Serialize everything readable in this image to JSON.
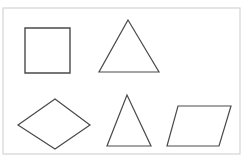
{
  "figure": {
    "canvas": {
      "width": 246,
      "height": 161,
      "background_color": "#ffffff"
    },
    "frame": {
      "name": "outer-frame",
      "x": 3,
      "y": 8,
      "width": 237,
      "height": 146,
      "stroke_color": "#d4d4d4",
      "stroke_width": 1.2,
      "fill": "none"
    },
    "style": {
      "stroke_color": "#4a4a4a",
      "stroke_width": 1.2,
      "fill": "none"
    },
    "shape_count": 5,
    "rows": [
      {
        "label": "top-row",
        "shape_names": [
          "square",
          "equilateral-triangle"
        ]
      },
      {
        "label": "bottom-row",
        "shape_names": [
          "rhombus",
          "isosceles-triangle",
          "parallelogram"
        ]
      }
    ],
    "shapes": [
      {
        "id": "square",
        "name": "square",
        "row": "top-row",
        "sides": 4,
        "vertices": [
          [
            25,
            28
          ],
          [
            70,
            28
          ],
          [
            70,
            73
          ],
          [
            25,
            73
          ]
        ],
        "points": "25,28 70,28 70,73 25,73",
        "bbox": {
          "x": 25,
          "y": 28,
          "width": 45,
          "height": 45
        },
        "stroke_color": "#4a4a4a",
        "stroke_width": 1.4
      },
      {
        "id": "triangle-top",
        "name": "equilateral-triangle",
        "row": "top-row",
        "sides": 3,
        "vertices": [
          [
            128,
            20
          ],
          [
            159,
            72
          ],
          [
            99,
            72
          ]
        ],
        "points": "128,20 159,72 99,72",
        "bbox": {
          "x": 99,
          "y": 20,
          "width": 60,
          "height": 52
        },
        "stroke_color": "#4a4a4a",
        "stroke_width": 1.2
      },
      {
        "id": "rhombus",
        "name": "rhombus",
        "row": "bottom-row",
        "sides": 4,
        "vertices": [
          [
            55,
            99
          ],
          [
            90,
            125
          ],
          [
            55,
            149
          ],
          [
            18,
            125
          ]
        ],
        "points": "55,99 90,125 55,149 18,125",
        "bbox": {
          "x": 18,
          "y": 99,
          "width": 72,
          "height": 50
        },
        "stroke_color": "#4a4a4a",
        "stroke_width": 1.2
      },
      {
        "id": "triangle-bottom",
        "name": "isosceles-triangle",
        "row": "bottom-row",
        "sides": 3,
        "vertices": [
          [
            127,
            95
          ],
          [
            151,
            146
          ],
          [
            107,
            146
          ]
        ],
        "points": "127,95 151,146 107,146",
        "bbox": {
          "x": 107,
          "y": 95,
          "width": 44,
          "height": 51
        },
        "stroke_color": "#4a4a4a",
        "stroke_width": 1.2
      },
      {
        "id": "parallelogram",
        "name": "parallelogram",
        "row": "bottom-row",
        "sides": 4,
        "vertices": [
          [
            178,
            106
          ],
          [
            231,
            106
          ],
          [
            219,
            146
          ],
          [
            167,
            146
          ]
        ],
        "points": "178,106 231,106 219,146 167,146",
        "bbox": {
          "x": 167,
          "y": 106,
          "width": 64,
          "height": 40
        },
        "stroke_color": "#4a4a4a",
        "stroke_width": 1.2
      }
    ]
  }
}
